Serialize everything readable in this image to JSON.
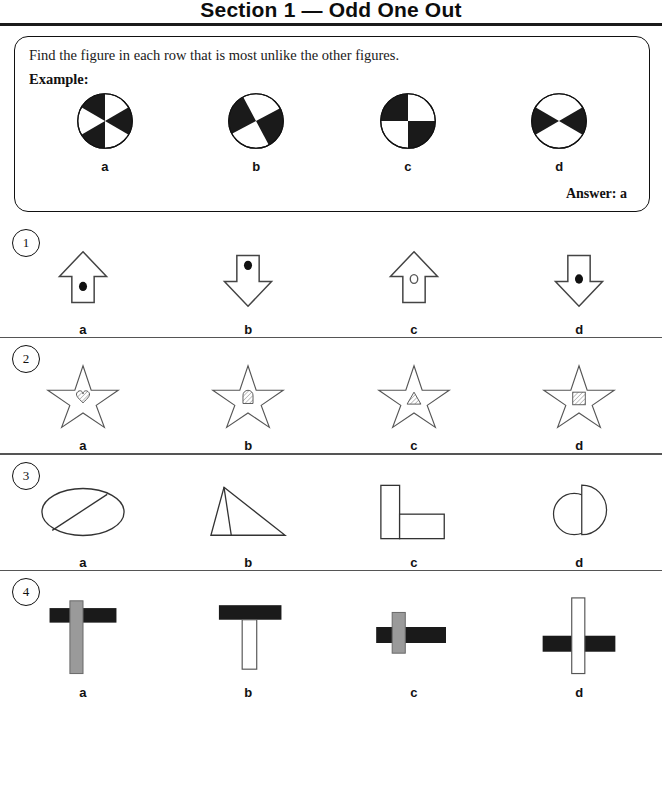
{
  "header": {
    "title": "Section 1 — Odd One Out"
  },
  "example": {
    "instruction": "Find the figure in each row that is most unlike the other figures.",
    "label": "Example:",
    "answer": "Answer: a",
    "options": [
      {
        "letter": "a",
        "figure": "pie-6-sector-alternating"
      },
      {
        "letter": "b",
        "figure": "pie-4-sector-rotated"
      },
      {
        "letter": "c",
        "figure": "pie-4-sector-upright"
      },
      {
        "letter": "d",
        "figure": "pie-4-sector-hourglass"
      }
    ]
  },
  "questions": [
    {
      "number": "1",
      "options": [
        {
          "letter": "a",
          "figure": "arrow-up-filled-dot"
        },
        {
          "letter": "b",
          "figure": "arrow-down-filled-dot-top"
        },
        {
          "letter": "c",
          "figure": "arrow-up-open-circle"
        },
        {
          "letter": "d",
          "figure": "arrow-down-filled-dot"
        }
      ]
    },
    {
      "number": "2",
      "options": [
        {
          "letter": "a",
          "figure": "star-with-hatched-heart"
        },
        {
          "letter": "b",
          "figure": "star-with-hatched-rounded-rect"
        },
        {
          "letter": "c",
          "figure": "star-with-hatched-triangle"
        },
        {
          "letter": "d",
          "figure": "star-with-hatched-square"
        }
      ]
    },
    {
      "number": "3",
      "options": [
        {
          "letter": "a",
          "figure": "ellipse-with-diagonal-chord"
        },
        {
          "letter": "b",
          "figure": "triangle-with-inner-line"
        },
        {
          "letter": "c",
          "figure": "two-rectangles-l-shape"
        },
        {
          "letter": "d",
          "figure": "circle-with-semicircle"
        }
      ]
    },
    {
      "number": "4",
      "options": [
        {
          "letter": "a",
          "figure": "gray-vertical-bar-over-black-bar"
        },
        {
          "letter": "b",
          "figure": "white-vertical-bar-under-black-bar"
        },
        {
          "letter": "c",
          "figure": "gray-vertical-bar-short-over-black-bar"
        },
        {
          "letter": "d",
          "figure": "white-vertical-bar-over-split-black-bar"
        }
      ]
    }
  ],
  "colors": {
    "ink": "#111111",
    "fill_black": "#1a1a1a",
    "fill_gray": "#999999",
    "rule": "#555555"
  }
}
